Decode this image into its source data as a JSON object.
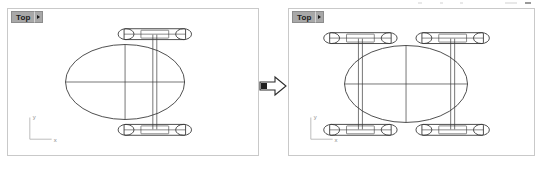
{
  "app": {
    "kind": "cad-viewport-comparison",
    "background_color": "#ffffff",
    "panel_border_color": "#c9c9c9",
    "geometry_stroke_color": "#3a3a3a",
    "title_tab_color": "#a8a8a8"
  },
  "panels": [
    {
      "id": "before",
      "title": "Top",
      "title_dropdown_icon": "chevron-right-icon",
      "axis_gizmo": {
        "y_label": "y",
        "x_label": "x"
      },
      "objects": {
        "ellipse": {
          "cx": 118,
          "cy": 74,
          "rx": 60,
          "ry": 38
        },
        "assemblies": 1,
        "description": "single axle assembly with two wheel pairs"
      }
    },
    {
      "id": "after",
      "title": "Top",
      "title_dropdown_icon": "chevron-right-icon",
      "axis_gizmo": {
        "y_label": "y",
        "x_label": "x"
      },
      "objects": {
        "ellipse": {
          "cx": 118,
          "cy": 74,
          "rx": 60,
          "ry": 38
        },
        "assemblies": 2,
        "description": "mirrored pair of axle assemblies flanking the ellipse"
      }
    }
  ],
  "transition": {
    "icon": "right-arrow-icon",
    "label": ""
  }
}
